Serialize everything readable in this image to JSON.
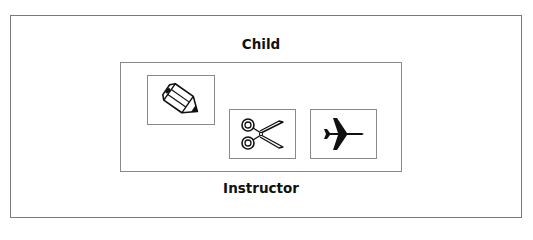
{
  "diagram": {
    "outer_label": "Child",
    "inner_label": "Instructor",
    "items": [
      {
        "icon": "pencil-icon"
      },
      {
        "icon": "scissors-icon"
      },
      {
        "icon": "airplane-icon"
      }
    ]
  }
}
